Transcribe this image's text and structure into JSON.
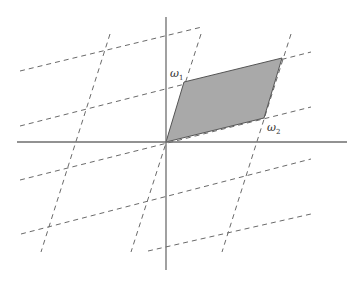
{
  "diagram": {
    "colors": {
      "background": "#ffffff",
      "axis": "#6e6e6e",
      "dashed_lines": "#6a6a6a",
      "cell_fill": "#a9a9a9",
      "cell_edge": "#555555"
    },
    "origin": [
      166,
      142
    ],
    "axes": {
      "horizontal": {
        "x1": 17,
        "y1": 142,
        "x2": 347,
        "y2": 142
      },
      "vertical": {
        "x1": 166,
        "y1": 17,
        "x2": 166,
        "y2": 270
      }
    },
    "fundamental_parallelogram": {
      "points": [
        [
          166,
          142
        ],
        [
          184,
          82
        ],
        [
          282,
          58
        ],
        [
          264,
          118
        ]
      ]
    },
    "labels": [
      {
        "id": "omega1",
        "symbol": "ω",
        "subscript": "1",
        "x": 170,
        "y": 68
      },
      {
        "id": "omega2",
        "symbol": "ω",
        "subscript": "2",
        "x": 267,
        "y": 122
      }
    ],
    "dashed_lines_w2_direction": [
      {
        "x1": 20,
        "y1": 71,
        "x2": 202,
        "y2": 27
      },
      {
        "x1": 20,
        "y1": 126,
        "x2": 311,
        "y2": 52
      },
      {
        "x1": 20,
        "y1": 180,
        "x2": 311,
        "y2": 107
      },
      {
        "x1": 21,
        "y1": 234,
        "x2": 311,
        "y2": 159
      },
      {
        "x1": 148,
        "y1": 251,
        "x2": 311,
        "y2": 214
      }
    ],
    "dashed_lines_w1_direction": [
      {
        "x1": 110,
        "y1": 34,
        "x2": 41,
        "y2": 252
      },
      {
        "x1": 201,
        "y1": 34,
        "x2": 131,
        "y2": 252
      },
      {
        "x1": 291,
        "y1": 34,
        "x2": 222,
        "y2": 252
      }
    ]
  }
}
